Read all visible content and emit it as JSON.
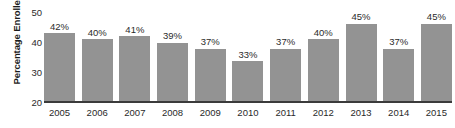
{
  "chart_data": {
    "type": "bar",
    "title": "",
    "xlabel": "",
    "ylabel": "Percentage Enrolled",
    "categories": [
      "2005",
      "2006",
      "2007",
      "2008",
      "2009",
      "2010",
      "2011",
      "2012",
      "2013",
      "2014",
      "2015"
    ],
    "values": [
      42,
      40,
      41,
      39,
      37,
      33,
      37,
      40,
      45,
      37,
      45
    ],
    "data_labels": [
      "42%",
      "40%",
      "41%",
      "39%",
      "37%",
      "33%",
      "37%",
      "40%",
      "45%",
      "37%",
      "45%"
    ],
    "ylim": [
      20,
      50
    ],
    "yticks": [
      50,
      40,
      30,
      20
    ],
    "ytick_labels": [
      "50",
      "40",
      "30",
      "20"
    ],
    "grid": false,
    "legend": null,
    "bar_color": "#939393",
    "axis_color": "#3b3b3b",
    "text_color": "#2a2a2a",
    "background_color": "#ffffff"
  }
}
